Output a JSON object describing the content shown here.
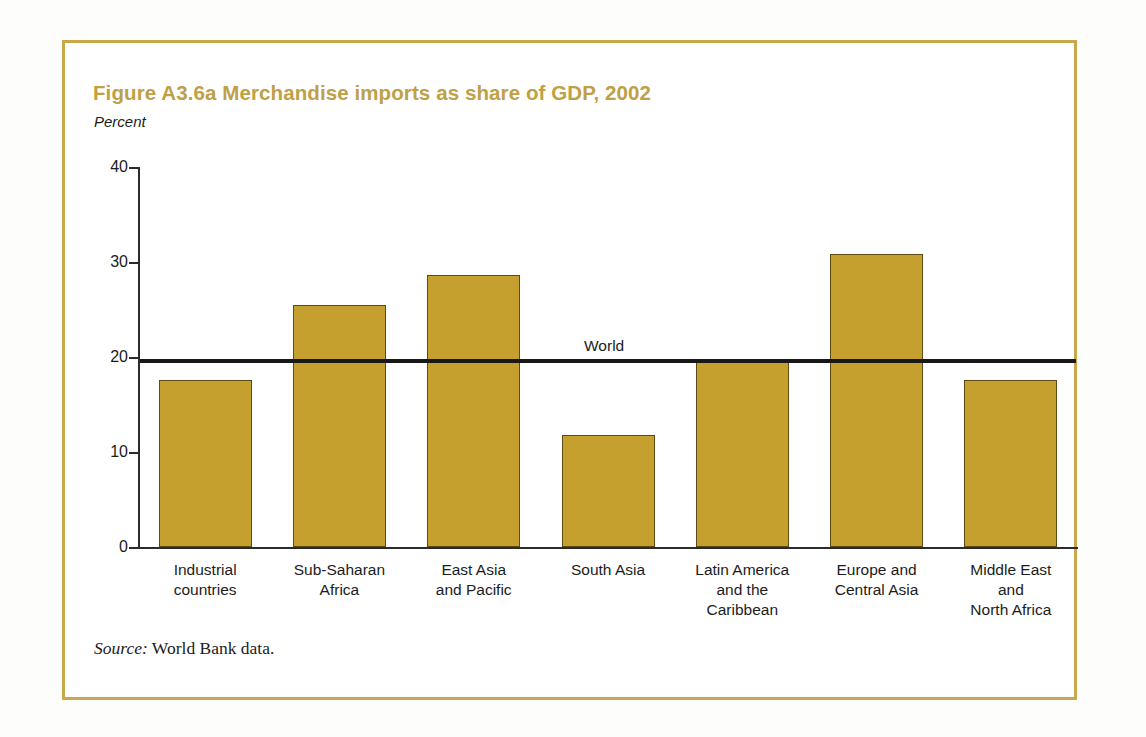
{
  "figure": {
    "title": "Figure A3.6a  Merchandise imports as share of GDP, 2002",
    "unit_label": "Percent",
    "source_label": "Source:",
    "source_text": " World Bank data.",
    "frame_color": "#c8a84b",
    "title_color": "#bfa046"
  },
  "chart_data": {
    "type": "bar",
    "title": "Figure A3.6a  Merchandise imports as share of GDP, 2002",
    "xlabel": "",
    "ylabel": "Percent",
    "ylim": [
      0,
      40
    ],
    "yticks": [
      0,
      10,
      20,
      30,
      40
    ],
    "ytick_labels": [
      "0",
      "10",
      "20",
      "30",
      "40"
    ],
    "grid": false,
    "legend": "none",
    "bar_color": "#c5a02e",
    "bar_edge_color": "#5d4a14",
    "categories": [
      "Industrial\ncountries",
      "Sub-Saharan\nAfrica",
      "East Asia\nand Pacific",
      "South Asia",
      "Latin America\nand the\nCaribbean",
      "Europe and\nCentral Asia",
      "Middle East\nand\nNorth Africa"
    ],
    "category_lines": [
      [
        "Industrial",
        "countries"
      ],
      [
        "Sub-Saharan",
        "Africa"
      ],
      [
        "East Asia",
        "and Pacific"
      ],
      [
        "South Asia"
      ],
      [
        "Latin America",
        "and the",
        "Caribbean"
      ],
      [
        "Europe and",
        "Central Asia"
      ],
      [
        "Middle East",
        "and",
        "North Africa"
      ]
    ],
    "values": [
      17.6,
      25.5,
      28.6,
      11.8,
      19.8,
      30.8,
      17.6
    ],
    "reference_line": {
      "label": "World",
      "value": 19.7,
      "color": "#181818"
    }
  }
}
